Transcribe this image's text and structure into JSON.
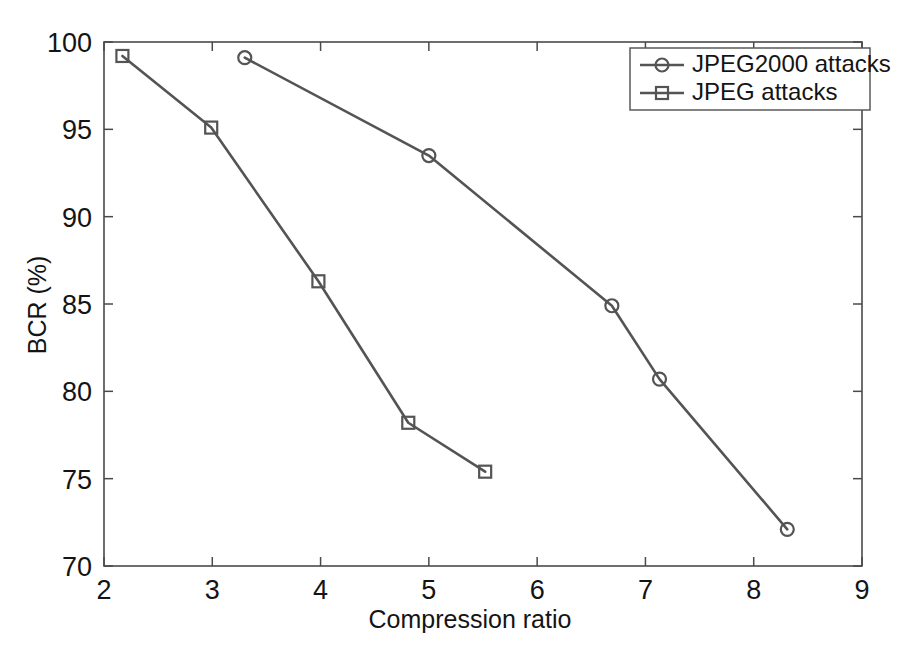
{
  "chart_data": {
    "type": "line",
    "title": "",
    "xlabel": "Compression ratio",
    "ylabel": "BCR (%)",
    "xlim": [
      2,
      9
    ],
    "ylim": [
      70,
      100
    ],
    "xticks": [
      2,
      3,
      4,
      5,
      6,
      7,
      8,
      9
    ],
    "xtick_labels": [
      "2",
      "3",
      "4",
      "5",
      "6",
      "7",
      "8",
      "9"
    ],
    "yticks": [
      70,
      75,
      80,
      85,
      90,
      95,
      100
    ],
    "ytick_labels": [
      "70",
      "75",
      "80",
      "85",
      "90",
      "95",
      "100"
    ],
    "grid": false,
    "legend_position": "top-right",
    "line_color": "#545454",
    "series": [
      {
        "name": "JPEG2000 attacks",
        "marker": "circle",
        "x": [
          3.3,
          5.0,
          6.69,
          7.13,
          8.31
        ],
        "y": [
          99.1,
          93.5,
          84.9,
          80.7,
          72.1
        ]
      },
      {
        "name": "JPEG attacks",
        "marker": "square",
        "x": [
          2.17,
          2.99,
          3.98,
          4.81,
          5.52
        ],
        "y": [
          99.2,
          95.1,
          86.3,
          78.2,
          75.4
        ]
      }
    ]
  },
  "legend": {
    "entries": [
      {
        "label": "JPEG2000 attacks",
        "marker": "circle"
      },
      {
        "label": "JPEG attacks",
        "marker": "square"
      }
    ]
  }
}
